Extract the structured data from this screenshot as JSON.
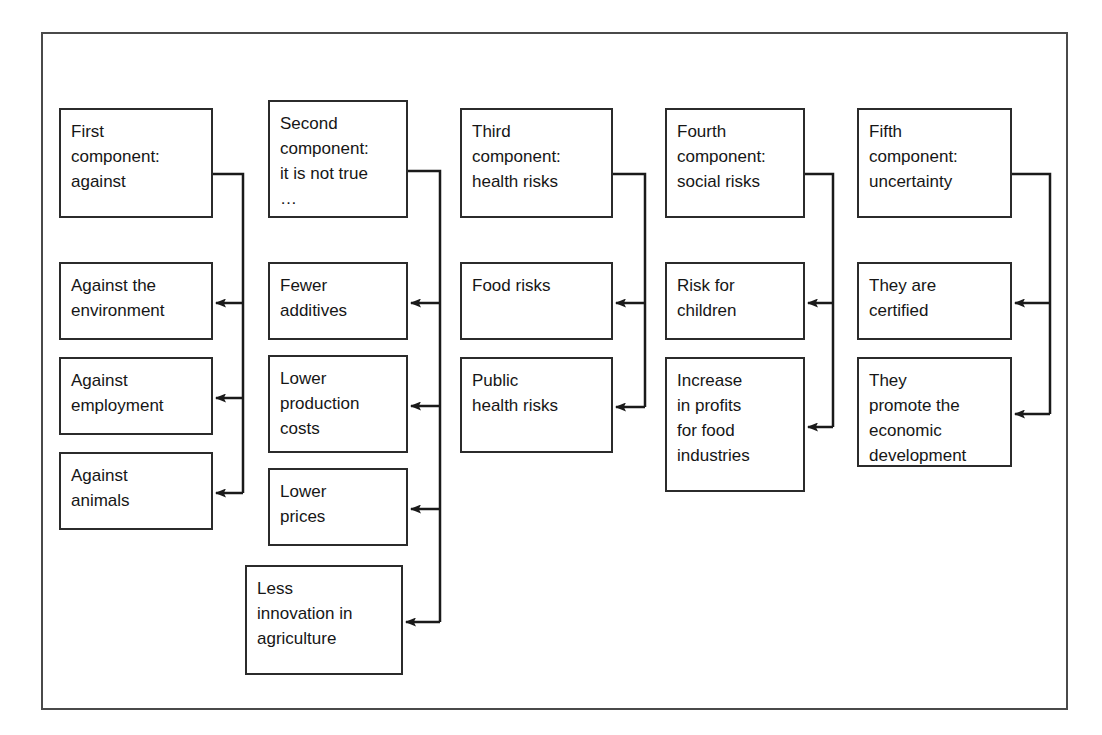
{
  "diagram": {
    "frame": {
      "x": 41,
      "y": 32,
      "width": 1027,
      "height": 678
    },
    "canvas": {
      "width": 1102,
      "height": 735
    },
    "colors": {
      "frame_border": "#4a4a4a",
      "box_border": "#2b2b2b",
      "text": "#161616",
      "background": "#ffffff",
      "connector": "#1a1a1a"
    },
    "columns": [
      {
        "id": "column-1",
        "bus_x": 243,
        "header": {
          "id": "first-component",
          "label": "First\ncomponent:\nagainst",
          "x": 59,
          "y": 108,
          "width": 154,
          "height": 110
        },
        "children": [
          {
            "id": "against-the-environment",
            "label": "Against the\nenvironment",
            "x": 59,
            "y": 262,
            "width": 154,
            "height": 78
          },
          {
            "id": "against-employment",
            "label": "Against\nemployment",
            "x": 59,
            "y": 357,
            "width": 154,
            "height": 78
          },
          {
            "id": "against-animals",
            "label": "Against\nanimals",
            "x": 59,
            "y": 452,
            "width": 154,
            "height": 78
          }
        ]
      },
      {
        "id": "column-2",
        "bus_x": 440,
        "header": {
          "id": "second-component",
          "label": "Second\ncomponent:\nit is not true\n…",
          "x": 268,
          "y": 100,
          "width": 140,
          "height": 118
        },
        "children": [
          {
            "id": "fewer-additives",
            "label": "Fewer\nadditives",
            "x": 268,
            "y": 262,
            "width": 140,
            "height": 78
          },
          {
            "id": "lower-production-costs",
            "label": "Lower\nproduction\ncosts",
            "x": 268,
            "y": 355,
            "width": 140,
            "height": 98
          },
          {
            "id": "lower-prices",
            "label": "Lower\nprices",
            "x": 268,
            "y": 468,
            "width": 140,
            "height": 78
          },
          {
            "id": "less-innovation-in-agriculture",
            "label": "Less\ninnovation in\nagriculture",
            "x": 245,
            "y": 565,
            "width": 158,
            "height": 110
          }
        ]
      },
      {
        "id": "column-3",
        "bus_x": 645,
        "header": {
          "id": "third-component",
          "label": "Third\ncomponent:\nhealth risks",
          "x": 460,
          "y": 108,
          "width": 153,
          "height": 110
        },
        "children": [
          {
            "id": "food-risks",
            "label": "Food risks",
            "x": 460,
            "y": 262,
            "width": 153,
            "height": 78
          },
          {
            "id": "public-health-risks",
            "label": "Public\nhealth risks",
            "x": 460,
            "y": 357,
            "width": 153,
            "height": 96
          }
        ]
      },
      {
        "id": "column-4",
        "bus_x": 833,
        "header": {
          "id": "fourth-component",
          "label": "Fourth\ncomponent:\nsocial risks",
          "x": 665,
          "y": 108,
          "width": 140,
          "height": 110
        },
        "children": [
          {
            "id": "risk-for-children",
            "label": "Risk for\nchildren",
            "x": 665,
            "y": 262,
            "width": 140,
            "height": 78
          },
          {
            "id": "increase-in-profits-for-food-industries",
            "label": "Increase\nin profits\nfor food\nindustries",
            "x": 665,
            "y": 357,
            "width": 140,
            "height": 135
          }
        ]
      },
      {
        "id": "column-5",
        "bus_x": 1050,
        "header": {
          "id": "fifth-component",
          "label": "Fifth\ncomponent:\nuncertainty",
          "x": 857,
          "y": 108,
          "width": 155,
          "height": 110
        },
        "children": [
          {
            "id": "they-are-certified",
            "label": "They are\ncertified",
            "x": 857,
            "y": 262,
            "width": 155,
            "height": 78
          },
          {
            "id": "they-promote-the-economic-development",
            "label": "They\npromote the\neconomic\ndevelopment",
            "x": 857,
            "y": 357,
            "width": 155,
            "height": 110
          }
        ]
      }
    ]
  }
}
